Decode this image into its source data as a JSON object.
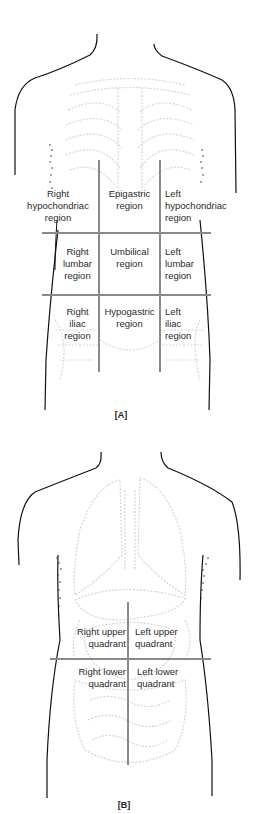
{
  "figures": [
    {
      "id": "A",
      "caption": "[A]",
      "title": "Nine abdominal regions",
      "regions": [
        {
          "line1": "Right",
          "line2": "hypochondriac",
          "line3": "region"
        },
        {
          "line1": "Epigastric",
          "line2": "region"
        },
        {
          "line1": "Left",
          "line2": "hypochondriac",
          "line3": "region"
        },
        {
          "line1": "Right",
          "line2": "lumbar",
          "line3": "region"
        },
        {
          "line1": "Umbilical",
          "line2": "region"
        },
        {
          "line1": "Left",
          "line2": "lumbar",
          "line3": "region"
        },
        {
          "line1": "Right",
          "line2": "iliac",
          "line3": "region"
        },
        {
          "line1": "Hypogastric",
          "line2": "region"
        },
        {
          "line1": "Left",
          "line2": "iliac",
          "line3": "region"
        }
      ]
    },
    {
      "id": "B",
      "caption": "[B]",
      "title": "Four abdominal quadrants",
      "quadrants": [
        {
          "line1": "Right upper",
          "line2": "quadrant"
        },
        {
          "line1": "Left upper",
          "line2": "quadrant"
        },
        {
          "line1": "Right lower",
          "line2": "quadrant"
        },
        {
          "line1": "Left lower",
          "line2": "quadrant"
        }
      ]
    }
  ],
  "colors": {
    "outline": "#111111",
    "grid_lines": "#8a8a8a",
    "organ_shading": "#d4d4d4",
    "text": "#2a2a2a"
  }
}
